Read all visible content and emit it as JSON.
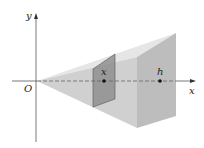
{
  "diagram": {
    "labels": {
      "y_axis": "y",
      "x_axis": "x",
      "origin": "O",
      "section_point": "x",
      "base_point": "h"
    },
    "colors": {
      "background": "#ffffff",
      "top_face": "#e4e4e4",
      "side_face": "#c9c9c9",
      "back_face": "#bdbdbd",
      "cross_section": "#8e8e8e",
      "axis": "#555555"
    }
  }
}
